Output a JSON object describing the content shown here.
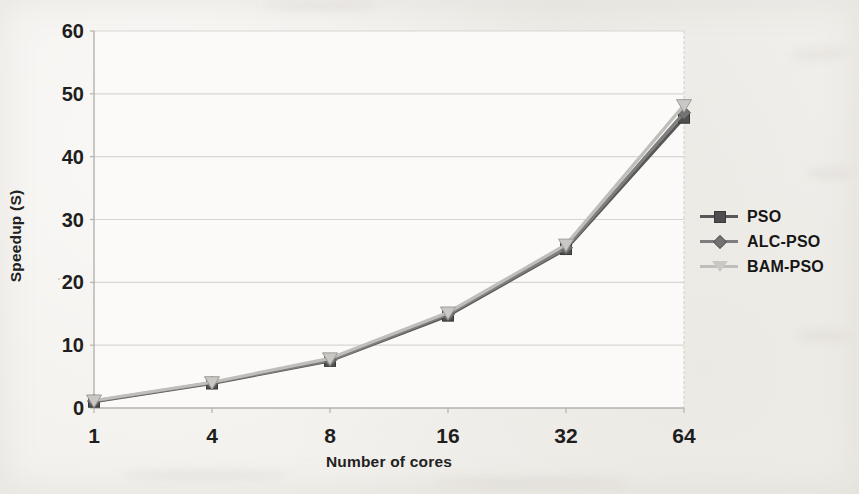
{
  "chart_data": {
    "type": "line",
    "title": "",
    "xlabel": "Number of cores",
    "ylabel": "Speedup (S)",
    "categories": [
      "1",
      "4",
      "8",
      "16",
      "32",
      "64"
    ],
    "ylim": [
      0,
      60
    ],
    "y_ticks": [
      0,
      10,
      20,
      30,
      40,
      50,
      60
    ],
    "grid": "horizontal gridlines on, plot border on right",
    "legend_position": "right, no border",
    "series": [
      {
        "name": "PSO",
        "marker": "square",
        "line_color": "#585858",
        "marker_fill": "#4f4f4f",
        "marker_stroke": "#383838",
        "values": [
          1.0,
          3.9,
          7.5,
          14.7,
          25.3,
          46.2
        ]
      },
      {
        "name": "ALC-PSO",
        "marker": "diamond",
        "line_color": "#7e7e7e",
        "marker_fill": "#737373",
        "marker_stroke": "#5e5e5e",
        "values": [
          1.1,
          4.0,
          7.6,
          14.9,
          25.5,
          47.0
        ]
      },
      {
        "name": "BAM-PSO",
        "marker": "triangle-down",
        "line_color": "#bfbebb",
        "marker_fill": "#c9c8c5",
        "marker_stroke": "#9e9d9a",
        "values": [
          1.2,
          4.1,
          7.9,
          15.2,
          26.0,
          48.2
        ]
      }
    ]
  },
  "style": {
    "page_bg": "#f2f0ec",
    "plot_bg": "#fbfaf8",
    "grid_color": "#d7d6d2",
    "axis_color": "#b3b2ae",
    "text_color": "#1e1e1e"
  }
}
